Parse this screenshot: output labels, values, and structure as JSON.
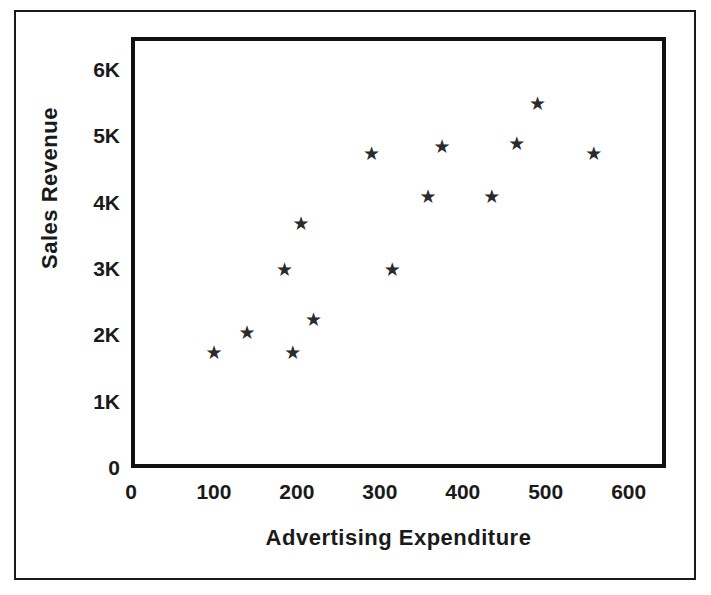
{
  "chart_data": {
    "type": "scatter",
    "title": "",
    "xlabel": "Advertising  Expenditure",
    "ylabel": "Sales Revenue",
    "xlim": [
      0,
      645
    ],
    "ylim": [
      0,
      6500
    ],
    "xticks": [
      "0",
      "100",
      "200",
      "300",
      "400",
      "500",
      "600"
    ],
    "xtick_values": [
      0,
      100,
      200,
      300,
      400,
      500,
      600
    ],
    "yticks": [
      "0",
      "1K",
      "2K",
      "3K",
      "4K",
      "5K",
      "6K"
    ],
    "ytick_values": [
      0,
      1000,
      2000,
      3000,
      4000,
      5000,
      6000
    ],
    "grid": false,
    "legend": null,
    "marker": "star",
    "marker_color": "#2b2b2b",
    "points": [
      {
        "x": 100,
        "y": 1750
      },
      {
        "x": 140,
        "y": 2050
      },
      {
        "x": 185,
        "y": 3000
      },
      {
        "x": 195,
        "y": 1750
      },
      {
        "x": 205,
        "y": 3700
      },
      {
        "x": 220,
        "y": 2250
      },
      {
        "x": 290,
        "y": 4750
      },
      {
        "x": 315,
        "y": 3000
      },
      {
        "x": 358,
        "y": 4100
      },
      {
        "x": 375,
        "y": 4850
      },
      {
        "x": 435,
        "y": 4100
      },
      {
        "x": 465,
        "y": 4900
      },
      {
        "x": 490,
        "y": 5500
      },
      {
        "x": 558,
        "y": 4750
      }
    ]
  },
  "figure": {
    "background_color": "#ffffff",
    "frame_color": "#111111",
    "text_color": "#1a1a1a",
    "marker_glyph": "★"
  }
}
